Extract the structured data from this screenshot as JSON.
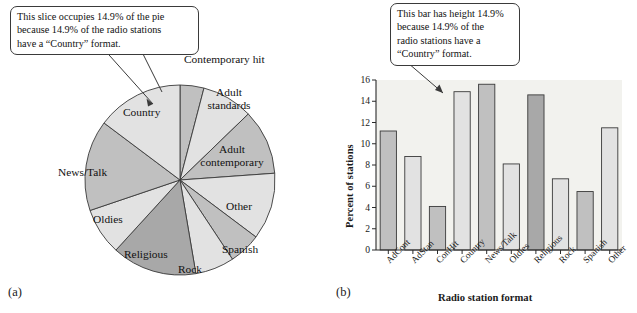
{
  "figure": {
    "panel_a_letter": "(a)",
    "panel_b_letter": "(b)"
  },
  "pie_panel": {
    "callout": {
      "lines": [
        "This slice occupies 14.9% of the pie",
        "because 14.9% of the radio stations",
        "have a “Country” format."
      ]
    },
    "labels": {
      "contemporary_hit": "Contemporary hit",
      "adult_standards_1": "Adult",
      "adult_standards_2": "standards",
      "adult_contemporary_1": "Adult",
      "adult_contemporary_2": "contemporary",
      "other": "Other",
      "spanish": "Spanish",
      "rock": "Rock",
      "religious": "Religious",
      "oldies": "Oldies",
      "news_talk": "News/Talk",
      "country": "Country"
    }
  },
  "bar_panel": {
    "callout": {
      "lines": [
        "This bar has height 14.9%",
        "because 14.9% of the",
        "radio stations have a",
        "“Country” format."
      ]
    }
  },
  "colors": {
    "light_gray": "#e2e2e2",
    "medium_gray": "#c0c0c0",
    "dark_gray": "#a8a8a8",
    "outline": "#3a3a3a",
    "plot_background": "#f2f2ee",
    "text": "#111111"
  },
  "chart_data": [
    {
      "type": "pie",
      "title": "",
      "id": "panel-a-pie",
      "categories": [
        "Contemporary hit",
        "Adult standards",
        "Adult contemporary",
        "Other",
        "Spanish",
        "Rock",
        "Religious",
        "Oldies",
        "News/Talk",
        "Country"
      ],
      "values": [
        4.1,
        8.8,
        11.2,
        11.5,
        5.5,
        6.7,
        14.6,
        8.1,
        15.6,
        14.9
      ],
      "units": "percent",
      "start_angle_deg": 0,
      "direction": "clockwise",
      "slice_shades": [
        "medium_gray",
        "light_gray",
        "medium_gray",
        "light_gray",
        "medium_gray",
        "light_gray",
        "dark_gray",
        "light_gray",
        "medium_gray",
        "light_gray"
      ],
      "annotation": "This slice occupies 14.9% of the pie because 14.9% of the radio stations have a “Country” format.",
      "annotation_target": "Country"
    },
    {
      "type": "bar",
      "id": "panel-b-bar",
      "title": "",
      "xlabel": "Radio station format",
      "ylabel": "Percent of stations",
      "categories": [
        "AdCont",
        "AdStan",
        "ConHit",
        "Country",
        "News/Talk",
        "Oldies",
        "Religious",
        "Rock",
        "Spanish",
        "Other"
      ],
      "values": [
        11.2,
        8.8,
        4.1,
        14.9,
        15.6,
        8.1,
        14.6,
        6.7,
        5.5,
        11.5
      ],
      "bar_shades": [
        "medium_gray",
        "light_gray",
        "medium_gray",
        "light_gray",
        "medium_gray",
        "light_gray",
        "dark_gray",
        "light_gray",
        "medium_gray",
        "light_gray"
      ],
      "ylim": [
        0,
        16
      ],
      "yticks": [
        0,
        2,
        4,
        6,
        8,
        10,
        12,
        14,
        16
      ],
      "ytick_labels": [
        "0",
        "2",
        "4",
        "6",
        "8",
        "10",
        "12",
        "14",
        "16"
      ],
      "grid": false,
      "legend": false,
      "annotation": "This bar has height 14.9% because 14.9% of the radio stations have a “Country” format.",
      "annotation_target": "Country"
    }
  ]
}
